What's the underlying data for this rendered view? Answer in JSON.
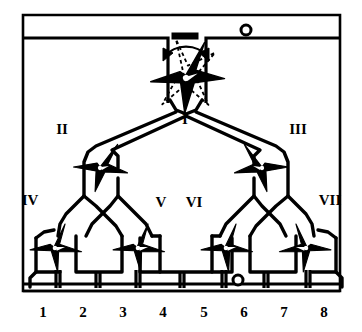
{
  "figure": {
    "colors": {
      "ink": "#000000",
      "paper": "#ffffff"
    }
  },
  "labels": {
    "roman": [
      {
        "id": "I",
        "text": "I",
        "x": 185,
        "y": 124
      },
      {
        "id": "II",
        "text": "II",
        "x": 62,
        "y": 134
      },
      {
        "id": "III",
        "text": "III",
        "x": 296,
        "y": 134
      },
      {
        "id": "IV",
        "text": "IV",
        "x": 27,
        "y": 205
      },
      {
        "id": "V",
        "text": "V",
        "x": 159,
        "y": 207
      },
      {
        "id": "VI",
        "text": "VI",
        "x": 190,
        "y": 207
      },
      {
        "id": "VII",
        "text": "VII",
        "x": 322,
        "y": 205
      }
    ],
    "ports": [
      {
        "id": "1",
        "text": "1",
        "x": 43,
        "y": 312
      },
      {
        "id": "2",
        "text": "2",
        "x": 82,
        "y": 312
      },
      {
        "id": "3",
        "text": "3",
        "x": 122,
        "y": 312
      },
      {
        "id": "4",
        "text": "4",
        "x": 163,
        "y": 312
      },
      {
        "id": "5",
        "text": "5",
        "x": 203,
        "y": 312
      },
      {
        "id": "6",
        "text": "6",
        "x": 243,
        "y": 312
      },
      {
        "id": "7",
        "text": "7",
        "x": 284,
        "y": 312
      },
      {
        "id": "8",
        "text": "8",
        "x": 324,
        "y": 312
      }
    ]
  },
  "annotations": {
    "rotation_arrow_name": "rotation-double-arrow",
    "stop_bar_name": "valve-stop-bar",
    "ghost_valve_name": "valve-rotated-ghost-outline"
  },
  "markers": {
    "top_right_port": {
      "x": 246,
      "y": 30,
      "r": 5
    },
    "bottom_port_6": {
      "x": 238,
      "y": 280,
      "r": 5
    }
  },
  "valves": [
    {
      "id": "I",
      "name": "rotary-star-valve-I",
      "cx": 186,
      "cy": 78,
      "scale": 1.22,
      "rotate": -10,
      "mirror": false
    },
    {
      "id": "II",
      "name": "rotary-star-valve-II",
      "cx": 100,
      "cy": 168,
      "scale": 0.98,
      "rotate": 0,
      "mirror": false
    },
    {
      "id": "III",
      "name": "rotary-star-valve-III",
      "cx": 262,
      "cy": 168,
      "scale": 0.98,
      "rotate": 0,
      "mirror": true
    },
    {
      "id": "IV",
      "name": "rotary-star-valve-IV",
      "cx": 54,
      "cy": 248,
      "scale": 0.92,
      "rotate": 0,
      "mirror": false
    },
    {
      "id": "V",
      "name": "rotary-star-valve-V",
      "cx": 137,
      "cy": 248,
      "scale": 0.92,
      "rotate": 0,
      "mirror": false
    },
    {
      "id": "VI",
      "name": "rotary-star-valve-VI",
      "cx": 225,
      "cy": 248,
      "scale": 0.92,
      "rotate": 0,
      "mirror": false
    },
    {
      "id": "VII",
      "name": "rotary-star-valve-VII",
      "cx": 307,
      "cy": 248,
      "scale": 0.92,
      "rotate": 0,
      "mirror": true
    }
  ]
}
